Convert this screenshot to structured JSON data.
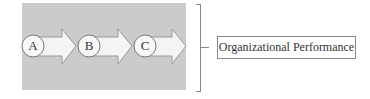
{
  "diagram": {
    "stages": [
      {
        "label": "A"
      },
      {
        "label": "B"
      },
      {
        "label": "C"
      }
    ],
    "outcome": {
      "label": "Organizational Performance"
    },
    "colors": {
      "panel": "#cbcbcb",
      "arrow_fill": "#f4f4f4",
      "stroke": "#888888"
    }
  }
}
